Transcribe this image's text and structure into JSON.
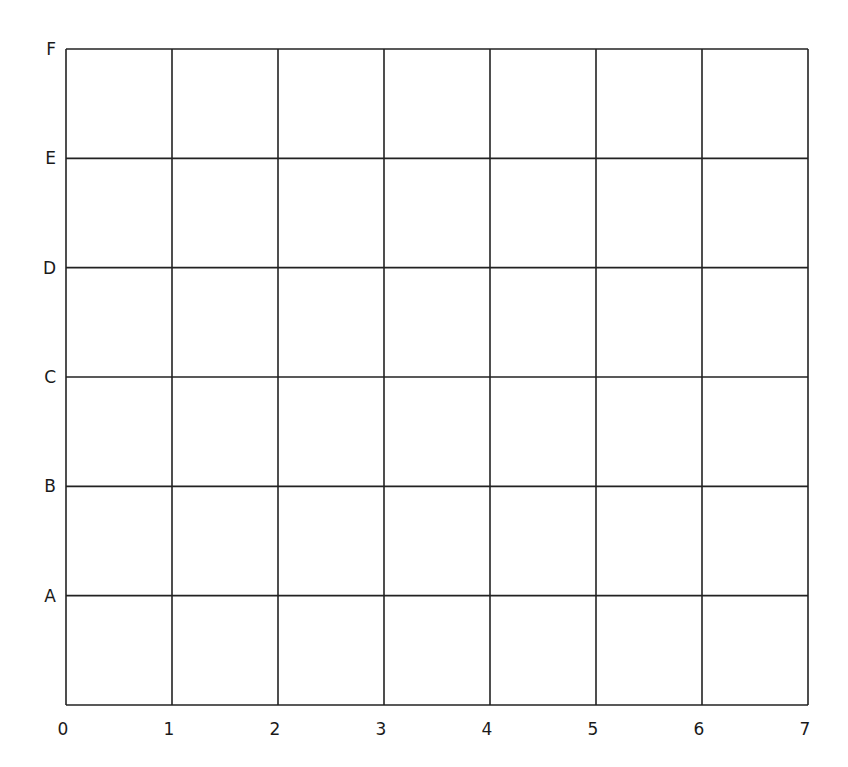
{
  "grid": {
    "x_labels": [
      "0",
      "1",
      "2",
      "3",
      "4",
      "5",
      "6",
      "7"
    ],
    "y_labels": [
      "A",
      "B",
      "C",
      "D",
      "E",
      "F"
    ],
    "columns": 7,
    "rows": 6,
    "line_color": "#222222",
    "background": "#ffffff"
  }
}
